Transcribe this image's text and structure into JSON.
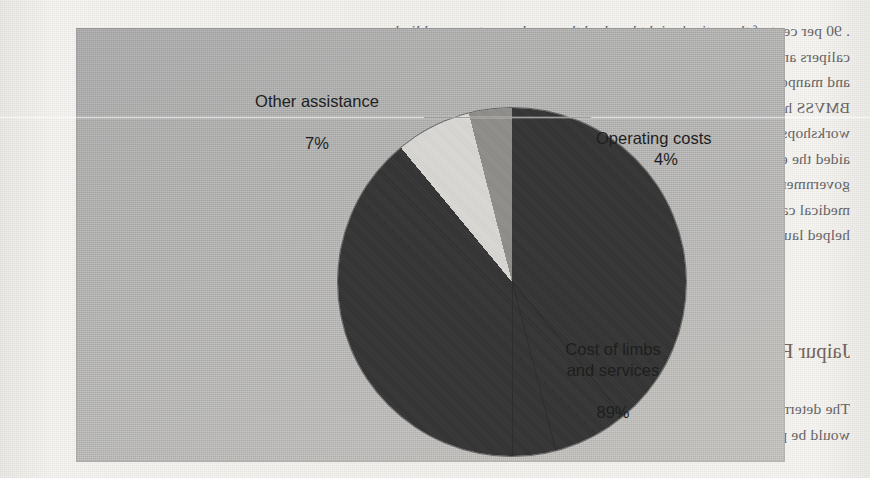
{
  "document": {
    "type": "scanned-book-page",
    "note_orientation": "mirrored",
    "body_top_lines": [
      ". 90 per cent of the nation's eight hundred thousand amputees need limbs,",
      "calipers and other aids and appliances. The average cost of a Jaipur Foot value",
      "and manpower system was around $30 to $40 in 2012.",
      "BMVSS has also established a nationwide network of roughly 60",
      "workshops that fabricate and fit the Jaipur Foot locally. The society also has",
      "aided the establishment of camps and clinics funded by the Indian",
      "government and philanthropic donors. Private and secular organizations offer",
      "medical care, room, board and meals free of charge to the patient. It also has",
      "helped launch free clinics in Kenya, Malawi and Nigeria."
    ],
    "heading": "Jaipur Foot: Fulfilling Demand",
    "body_bottom_lines": [
      "The determination was made at the outset that the Jaipur Foot prosthesis",
      "would be provided free by means of a nonprofit framework. The prospect of no"
    ]
  },
  "figure": {
    "plate_color": "#b7b6b3",
    "caption": ""
  },
  "chart_data": {
    "type": "pie",
    "title": "",
    "labels": [
      "Cost of limbs and services",
      "Other assistance",
      "Operating costs"
    ],
    "values": [
      89,
      7,
      4
    ],
    "unit": "%",
    "colors": [
      "#343434",
      "#d9d8d4",
      "#8e8d8a"
    ],
    "start_angle_deg": 0,
    "direction": "clockwise",
    "legend": "none (direct labels)",
    "annotations": [
      {
        "label": "Other assistance",
        "value": "7%",
        "placement": "upper-left",
        "leader": false
      },
      {
        "label": "Operating costs",
        "value": "4%",
        "placement": "upper-right",
        "leader": true
      },
      {
        "label": "Cost of limbs\nand services",
        "value": "89%",
        "placement": "lower-right",
        "leader": false
      }
    ],
    "slices": [
      {
        "name": "Cost of limbs and services",
        "percent": 89,
        "color": "#343434"
      },
      {
        "name": "Other assistance",
        "percent": 7,
        "color": "#d9d8d4"
      },
      {
        "name": "Operating costs",
        "percent": 4,
        "color": "#8e8d8a"
      }
    ]
  },
  "labels": {
    "other_assistance": "Other assistance",
    "other_assistance_pct": "7%",
    "operating_costs": "Operating costs",
    "operating_costs_pct": "4%",
    "cost_of_limbs": "Cost of limbs\nand services",
    "cost_of_limbs_pct": "89%"
  }
}
